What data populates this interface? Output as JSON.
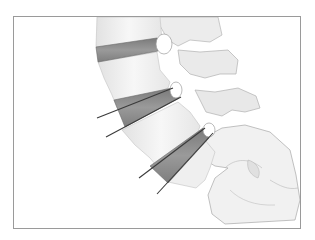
{
  "figure": {
    "colors": {
      "border": "#9a9a9a",
      "bone_fill": "#f4f4f4",
      "bone_shade": "#dcdcdc",
      "bone_outline": "#a8a8a8",
      "disc_fill": "#8c8c8c",
      "disc_dark": "#6e6e6e",
      "needle": "#3a3a3a"
    },
    "discs": [
      {
        "label": "upper disc"
      },
      {
        "label": "middle disc (needle inserted)"
      },
      {
        "label": "lower disc (needle inserted)"
      }
    ],
    "needles": [
      {
        "label": "needle 1a"
      },
      {
        "label": "needle 1b"
      },
      {
        "label": "needle 2a"
      },
      {
        "label": "needle 2b"
      }
    ]
  }
}
